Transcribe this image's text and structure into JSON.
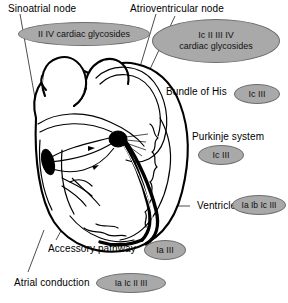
{
  "diagram": {
    "type": "anatomical-diagram",
    "colors": {
      "badge_fill": "#a9a9a9",
      "badge_stroke": "#6e6e6e",
      "outline": "#000000",
      "background": "#ffffff",
      "conduction_path": "#000000"
    }
  },
  "headings": {
    "sinoatrial_node": "Sinoatrial node",
    "atrioventricular_node": "Atrioventricular node"
  },
  "labels": {
    "bundle_of_his": "Bundle of His",
    "purkinje_system": "Purkinje system",
    "ventricle": "Ventricle",
    "accessory_pathway": "Accessory pathway",
    "atrial_conduction": "Atrial conduction"
  },
  "badges": {
    "sinoatrial": "II IV cardiac glycosides",
    "atrioventricular_line1": "Ic II III IV",
    "atrioventricular_line2": "cardiac glycosides",
    "bundle_of_his": "Ic III",
    "purkinje_system": "Ic III",
    "ventricle": "Ia Ib Ic III",
    "accessory_pathway": "Ia III",
    "atrial_conduction": "Ia Ic II III"
  },
  "structures": {
    "sa_node": "sinoatrial-node-marker",
    "av_node": "atrioventricular-node-marker"
  }
}
